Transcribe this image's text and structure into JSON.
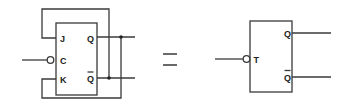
{
  "diagram": {
    "left_flipflop": {
      "type": "JK flip-flop",
      "inputs": [
        {
          "label": "J",
          "connection": "Q-bar (feedback)"
        },
        {
          "label": "C",
          "connection": "clock input, inverted (bubble)"
        },
        {
          "label": "K",
          "connection": "Q (feedback)"
        }
      ],
      "outputs": [
        {
          "label": "Q"
        },
        {
          "label": "Q",
          "overbar": true
        }
      ]
    },
    "equals_symbol": "=",
    "right_flipflop": {
      "type": "T flip-flop",
      "inputs": [
        {
          "label": "T",
          "connection": "input, inverted (bubble)"
        }
      ],
      "outputs": [
        {
          "label": "Q"
        },
        {
          "label": "Q",
          "overbar": true
        }
      ]
    },
    "colors": {
      "line": "#3a3a3a",
      "text": "#222222",
      "background": "#ffffff"
    }
  }
}
